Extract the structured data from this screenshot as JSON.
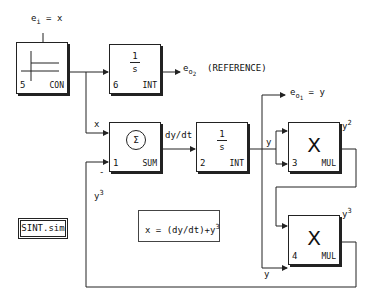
{
  "blocks": {
    "con": {
      "number": "5",
      "type": "CON"
    },
    "int6": {
      "number": "6",
      "type": "INT",
      "numerator": "1",
      "denominator": "s"
    },
    "sum": {
      "number": "1",
      "type": "SUM",
      "symbol": "Σ"
    },
    "int2": {
      "number": "2",
      "type": "INT",
      "numerator": "1",
      "denominator": "s"
    },
    "mul3": {
      "number": "3",
      "type": "MUL",
      "symbol": "X"
    },
    "mul4": {
      "number": "4",
      "type": "MUL",
      "symbol": "X"
    }
  },
  "labels": {
    "ei_main": "e",
    "ei_sub": "i",
    "ei_rest": "= x",
    "eo2_main": "e",
    "eo2_sub": "o",
    "eo2_subsub": "2",
    "reference": "(REFERENCE)",
    "eo1_main": "e",
    "eo1_sub": "o",
    "eo1_subsub": "1",
    "eo1_rest": "= y",
    "x_label": "x",
    "dydt_label": "dy/dt",
    "y_label_top": "y",
    "y_label_bottom": "y",
    "y2_base": "y",
    "y2_exp": "2",
    "y3_base_right": "y",
    "y3_exp_right": "3",
    "y3_base_left": "y",
    "y3_exp_left": "3",
    "minus_sign": "-"
  },
  "file_name": "SINT.sim",
  "equation": {
    "text": "x = (dy/dt)+y",
    "exp": "3"
  }
}
